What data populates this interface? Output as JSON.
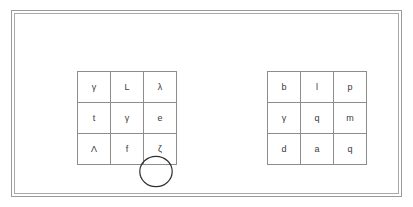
{
  "page": {
    "background_color": "#ffffff",
    "frame_color": "#9a9a9a",
    "grid_line_color": "#8d8d8d",
    "text_color": "#3a3a3a",
    "annotation_color": "#2f2f2f"
  },
  "grids": [
    {
      "id": "left-grid",
      "name": "left-letter-grid",
      "rows": [
        [
          "γ",
          "L",
          "λ"
        ],
        [
          "t",
          "γ",
          "e"
        ],
        [
          "Λ",
          "f",
          "ζ"
        ]
      ],
      "annotation": {
        "type": "circle",
        "target_row": 1,
        "target_col": 1,
        "target_value": "γ"
      }
    },
    {
      "id": "right-grid",
      "name": "right-letter-grid",
      "rows": [
        [
          "b",
          "l",
          "p"
        ],
        [
          "γ",
          "q",
          "m"
        ],
        [
          "d",
          "a",
          "q"
        ]
      ],
      "annotation": null
    }
  ]
}
